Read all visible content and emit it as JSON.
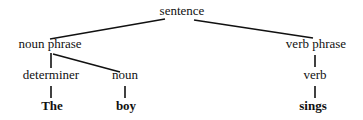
{
  "diagram": {
    "type": "syntax-tree",
    "nodes": {
      "sentence": "sentence",
      "noun_phrase": "noun phrase",
      "verb_phrase": "verb phrase",
      "determiner": "determiner",
      "noun": "noun",
      "verb": "verb",
      "word_the": "The",
      "word_boy": "boy",
      "word_sings": "sings"
    },
    "edges": [
      [
        "sentence",
        "noun phrase"
      ],
      [
        "sentence",
        "verb phrase"
      ],
      [
        "noun phrase",
        "determiner"
      ],
      [
        "noun phrase",
        "noun"
      ],
      [
        "verb phrase",
        "verb"
      ],
      [
        "determiner",
        "The"
      ],
      [
        "noun",
        "boy"
      ],
      [
        "verb",
        "sings"
      ]
    ],
    "colors": {
      "text": "#111111",
      "line": "#111111",
      "background": "#ffffff"
    }
  }
}
